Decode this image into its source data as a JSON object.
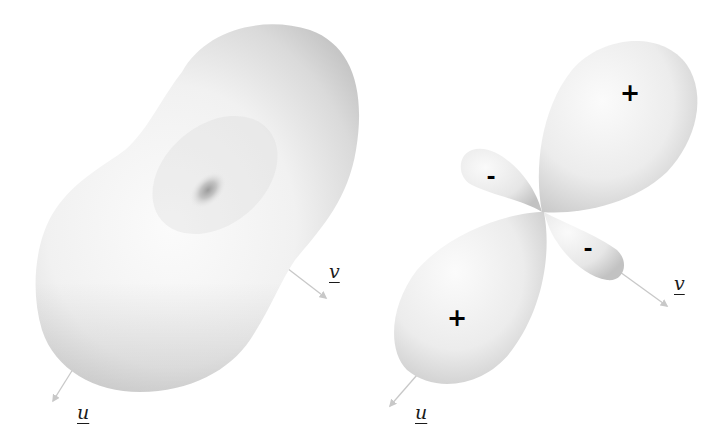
{
  "figure": {
    "panels": [
      {
        "id": "left",
        "description": "Peanut-shaped 3D surface with a dimple near its center",
        "axes": {
          "u_label": "u",
          "v_label": "v"
        }
      },
      {
        "id": "right",
        "description": "Four-lobed 3D surface (two large positive lobes, two small negative lobes)",
        "axes": {
          "u_label": "u",
          "v_label": "v"
        },
        "lobe_signs": {
          "upper_right": "+",
          "lower_left": "+",
          "upper_left": "-",
          "lower_right": "-"
        }
      }
    ],
    "colors": {
      "background": "#ffffff",
      "surface_light": "#f7f7f7",
      "surface_shade": "#c4c4c4",
      "axis_arrow": "#c8c8c8",
      "sign_text": "#000000"
    }
  }
}
